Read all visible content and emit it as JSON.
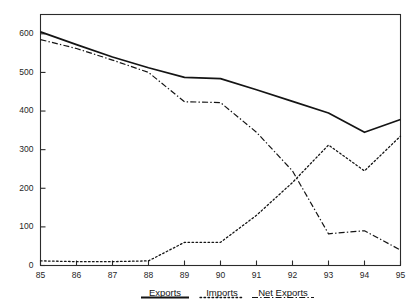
{
  "chart_data": {
    "type": "line",
    "title": "",
    "xlabel": "",
    "ylabel": "",
    "x": [
      85,
      86,
      87,
      88,
      89,
      90,
      91,
      92,
      93,
      94,
      95
    ],
    "categories": [
      "85",
      "86",
      "87",
      "88",
      "89",
      "90",
      "91",
      "92",
      "93",
      "94",
      "95"
    ],
    "xlim": [
      85,
      95
    ],
    "ylim": [
      0,
      650
    ],
    "yticks": [
      0,
      100,
      200,
      300,
      400,
      500,
      600
    ],
    "ytick_labels": [
      "0",
      "100",
      "200",
      "300",
      "400",
      "500",
      "600"
    ],
    "xticks": [
      85,
      86,
      87,
      88,
      89,
      90,
      91,
      92,
      93,
      94,
      95
    ],
    "xtick_labels": [
      "85",
      "86",
      "87",
      "88",
      "89",
      "90",
      "91",
      "92",
      "93",
      "94",
      "95"
    ],
    "grid": false,
    "legend_position": "bottom",
    "series": [
      {
        "name": "Exports",
        "style": "solid",
        "values": [
          605,
          572,
          540,
          512,
          487,
          484,
          455,
          425,
          395,
          345,
          378
        ]
      },
      {
        "name": "Imports",
        "style": "dotted",
        "values": [
          12,
          10,
          10,
          12,
          60,
          60,
          130,
          215,
          312,
          245,
          335
        ]
      },
      {
        "name": "Net Exports",
        "style": "dashdot",
        "values": [
          585,
          562,
          532,
          500,
          424,
          422,
          345,
          245,
          82,
          90,
          40
        ]
      }
    ]
  },
  "legend": {
    "items": [
      {
        "label": "Exports",
        "style": "solid"
      },
      {
        "label": "Imports",
        "style": "dotted"
      },
      {
        "label": "Net Exports",
        "style": "dashdot"
      }
    ]
  }
}
